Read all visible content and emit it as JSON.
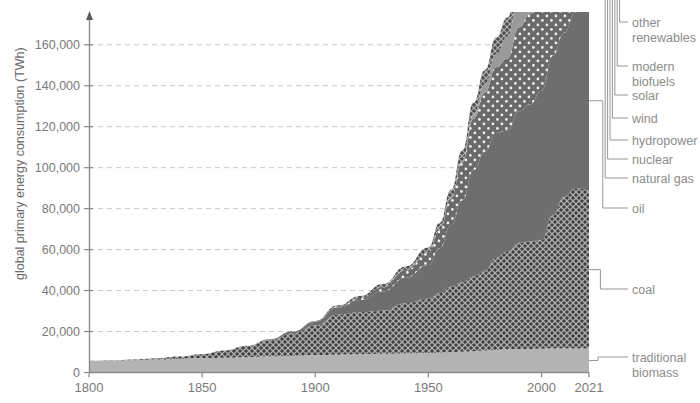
{
  "chart_data": {
    "type": "area",
    "title": "",
    "subtitle": "",
    "xlabel": "",
    "ylabel": "global primary energy consumption (TWh)",
    "xlim": [
      1800,
      2021
    ],
    "ylim": [
      0,
      176000
    ],
    "grid": true,
    "stacked": true,
    "legend_position": "right",
    "x_ticks": [
      "1800",
      "1850",
      "1900",
      "1950",
      "2000",
      "2021"
    ],
    "x_tick_values": [
      1800,
      1850,
      1900,
      1950,
      2000,
      2021
    ],
    "y_ticks": [
      "0",
      "20,000",
      "40,000",
      "60,000",
      "80,000",
      "100,000",
      "120,000",
      "140,000",
      "160,000"
    ],
    "y_tick_values": [
      0,
      20000,
      40000,
      60000,
      80000,
      100000,
      120000,
      140000,
      160000
    ],
    "x": [
      1800,
      1810,
      1820,
      1830,
      1840,
      1850,
      1860,
      1870,
      1880,
      1890,
      1900,
      1910,
      1920,
      1930,
      1940,
      1950,
      1955,
      1960,
      1965,
      1970,
      1975,
      1980,
      1985,
      1990,
      1995,
      2000,
      2005,
      2010,
      2015,
      2018,
      2021
    ],
    "series": [
      {
        "name": "traditional biomass",
        "color": "#b3b3b3",
        "pattern": "solid",
        "values": [
          5600,
          5800,
          6000,
          6300,
          6600,
          6900,
          7200,
          7500,
          7800,
          8100,
          8400,
          8700,
          8900,
          9100,
          9300,
          9500,
          9700,
          9900,
          10100,
          10400,
          10700,
          11000,
          11200,
          11400,
          11500,
          11600,
          11700,
          11700,
          11700,
          11700,
          11700
        ]
      },
      {
        "name": "coal",
        "color": "#4a4a4a",
        "pattern": "crosshatch",
        "values": [
          100,
          200,
          400,
          700,
          1200,
          2000,
          3500,
          5500,
          8000,
          11000,
          14500,
          19500,
          20500,
          21000,
          24500,
          26500,
          29000,
          32000,
          34000,
          36500,
          39000,
          45000,
          48000,
          52000,
          52500,
          53000,
          65000,
          74000,
          78000,
          78000,
          77000
        ]
      },
      {
        "name": "oil",
        "color": "#6e6e6e",
        "pattern": "solid",
        "values": [
          0,
          0,
          0,
          0,
          0,
          0,
          0,
          100,
          400,
          900,
          1800,
          3500,
          6000,
          9500,
          12500,
          16500,
          22000,
          30000,
          40000,
          52000,
          58000,
          61000,
          59000,
          64000,
          67000,
          73000,
          78000,
          80000,
          86000,
          90000,
          88000
        ]
      },
      {
        "name": "natural gas",
        "color": "#6a6a6a",
        "pattern": "dots",
        "values": [
          0,
          0,
          0,
          0,
          0,
          0,
          0,
          0,
          0,
          0,
          200,
          500,
          1000,
          2000,
          3500,
          6000,
          9000,
          13000,
          18500,
          25000,
          29000,
          32000,
          35000,
          41000,
          44000,
          50000,
          55000,
          60000,
          64000,
          68000,
          70000
        ]
      },
      {
        "name": "nuclear",
        "color": "#9a9a9a",
        "pattern": "solid",
        "values": [
          0,
          0,
          0,
          0,
          0,
          0,
          0,
          0,
          0,
          0,
          0,
          0,
          0,
          0,
          0,
          0,
          100,
          300,
          800,
          2000,
          4000,
          6500,
          11000,
          16000,
          18000,
          19000,
          19500,
          19000,
          18000,
          19000,
          19000
        ]
      },
      {
        "name": "hydropower",
        "color": "#585858",
        "pattern": "crosshatch",
        "values": [
          0,
          0,
          0,
          0,
          0,
          0,
          0,
          0,
          0,
          100,
          300,
          600,
          1000,
          1600,
          2000,
          2500,
          3200,
          4000,
          5000,
          6000,
          7000,
          8000,
          9000,
          10500,
          11500,
          12500,
          13500,
          15500,
          17000,
          18000,
          18500
        ]
      },
      {
        "name": "wind",
        "color": "#8a8a8a",
        "pattern": "solid",
        "values": [
          0,
          0,
          0,
          0,
          0,
          0,
          0,
          0,
          0,
          0,
          0,
          0,
          0,
          0,
          0,
          0,
          0,
          0,
          0,
          0,
          0,
          0,
          0,
          100,
          200,
          500,
          1000,
          2000,
          4000,
          5500,
          8000
        ]
      },
      {
        "name": "solar",
        "color": "#6f6f6f",
        "pattern": "solid",
        "values": [
          0,
          0,
          0,
          0,
          0,
          0,
          0,
          0,
          0,
          0,
          0,
          0,
          0,
          0,
          0,
          0,
          0,
          0,
          0,
          0,
          0,
          0,
          0,
          0,
          0,
          50,
          150,
          500,
          1800,
          3200,
          5000
        ]
      },
      {
        "name": "modern biofuels",
        "color": "#9e9e9e",
        "pattern": "solid",
        "values": [
          0,
          0,
          0,
          0,
          0,
          0,
          0,
          0,
          0,
          0,
          0,
          0,
          0,
          0,
          0,
          0,
          0,
          0,
          0,
          0,
          0,
          100,
          200,
          400,
          600,
          900,
          1500,
          2500,
          3200,
          3800,
          4000
        ]
      },
      {
        "name": "other renewables",
        "color": "#777777",
        "pattern": "solid",
        "values": [
          0,
          0,
          0,
          0,
          0,
          0,
          0,
          0,
          0,
          0,
          0,
          0,
          0,
          0,
          0,
          0,
          0,
          0,
          0,
          0,
          0,
          100,
          200,
          400,
          600,
          900,
          1200,
          1700,
          2200,
          2600,
          2800
        ]
      }
    ]
  },
  "legend": {
    "items": [
      {
        "label_line1": "other",
        "label_line2": "renewables",
        "key": "other-renewables"
      },
      {
        "label_line1": "modern",
        "label_line2": "biofuels",
        "key": "modern-biofuels"
      },
      {
        "label_line1": "solar",
        "label_line2": "",
        "key": "solar"
      },
      {
        "label_line1": "wind",
        "label_line2": "",
        "key": "wind"
      },
      {
        "label_line1": "hydropower",
        "label_line2": "",
        "key": "hydropower"
      },
      {
        "label_line1": "nuclear",
        "label_line2": "",
        "key": "nuclear"
      },
      {
        "label_line1": "natural gas",
        "label_line2": "",
        "key": "natural-gas"
      },
      {
        "label_line1": "oil",
        "label_line2": "",
        "key": "oil"
      },
      {
        "label_line1": "coal",
        "label_line2": "",
        "key": "coal"
      },
      {
        "label_line1": "traditional",
        "label_line2": "biomass",
        "key": "traditional-biomass"
      }
    ]
  }
}
